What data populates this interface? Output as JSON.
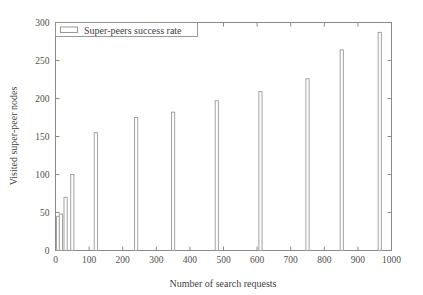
{
  "chart_data": {
    "type": "bar",
    "title": "",
    "subtitle": "",
    "xlabel": "Number of search requests",
    "ylabel": "Visited super-peer nodes",
    "xlim": [
      0,
      1000
    ],
    "ylim": [
      0,
      300
    ],
    "xticks": [
      0,
      100,
      200,
      300,
      400,
      500,
      600,
      700,
      800,
      900,
      1000
    ],
    "yticks": [
      0,
      50,
      100,
      150,
      200,
      250,
      300
    ],
    "xtick_labels": [
      "0",
      "100",
      "200",
      "300",
      "400",
      "500",
      "600",
      "700",
      "800",
      "900",
      "1000"
    ],
    "ytick_labels": [
      "0",
      "50",
      "100",
      "150",
      "200",
      "250",
      "300"
    ],
    "grid": false,
    "legend_position": "upper-left-inside",
    "series": [
      {
        "name": "Super-peers success rate",
        "x": [
          8,
          16,
          30,
          50,
          120,
          240,
          350,
          480,
          610,
          750,
          852,
          965
        ],
        "values": [
          45,
          48,
          70,
          100,
          155,
          175,
          182,
          197,
          209,
          226,
          264,
          287
        ]
      }
    ],
    "annotations": [],
    "colors": {
      "bar_fill": "#fdfdfd",
      "bar_stroke": "#9a9a9a",
      "axis": "#8a8a8a",
      "text": "#3f3f3f",
      "background": "#ffffff"
    }
  },
  "legend": {
    "entries": [
      {
        "label": "Super-peers success rate",
        "swatch": "open-rectangle"
      }
    ]
  },
  "axes": {
    "x_title": "Number of search requests",
    "y_title": "Visited super-peer nodes"
  }
}
